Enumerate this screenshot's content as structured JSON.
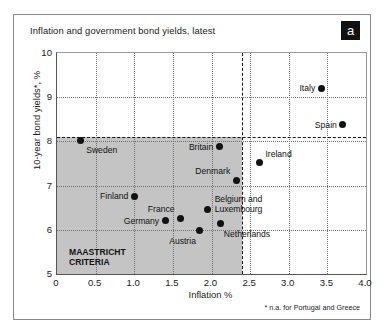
{
  "figure": {
    "title": "Inflation and government bond yields, latest",
    "panel_badge": "a",
    "footnote": "* n.a. for Portugal and Greece",
    "colors": {
      "shade": "#c4c4c4",
      "point": "#111111",
      "grid": "#707070",
      "threshold": "#111111",
      "border": "#8a8a8a"
    }
  },
  "axes": {
    "y_ticks": [
      "10",
      "9",
      "8",
      "7",
      "6",
      "5"
    ],
    "x_ticks": [
      "0",
      "0.5",
      "1.0",
      "1.5",
      "2.0",
      "2.5",
      "3.0",
      "3.5",
      "4.0"
    ],
    "ylabel": "10-year bond yields*, %",
    "xlabel": "Inflation %"
  },
  "maastricht": {
    "label_line1": "MAASTRICHT",
    "label_line2": "CRITERIA",
    "inflation_limit": 2.4,
    "yield_limit": 8.1
  },
  "chart_data": {
    "type": "scatter",
    "title": "Inflation and government bond yields, latest",
    "xlabel": "Inflation %",
    "ylabel": "10-year bond yields*, %",
    "xlim": [
      0,
      4.0
    ],
    "ylim": [
      5,
      10
    ],
    "xticks": [
      0,
      0.5,
      1.0,
      1.5,
      2.0,
      2.5,
      3.0,
      3.5,
      4.0
    ],
    "yticks": [
      5,
      6,
      7,
      8,
      9,
      10
    ],
    "grid": "dotted-both",
    "legend": "none",
    "annotations": {
      "maastricht_region": "MAASTRICHT CRITERIA",
      "maastricht_inflation_ceiling": 2.4,
      "maastricht_yield_ceiling": 8.1,
      "footnote": "* n.a. for Portugal and Greece"
    },
    "points": [
      {
        "name": "Sweden",
        "x": 0.3,
        "y": 8.03,
        "label_dx": 6,
        "label_dy": 5,
        "align": "left"
      },
      {
        "name": "Finland",
        "x": 1.0,
        "y": 6.76,
        "label_dx": -6,
        "label_dy": -5,
        "align": "right"
      },
      {
        "name": "Germany",
        "x": 1.4,
        "y": 6.2,
        "label_dx": -6,
        "label_dy": -5,
        "align": "right"
      },
      {
        "name": "France",
        "x": 1.6,
        "y": 6.25,
        "label_dx": -6,
        "label_dy": -15,
        "align": "right"
      },
      {
        "name": "Austria",
        "x": 1.85,
        "y": 5.98,
        "label_dx": -4,
        "label_dy": 5,
        "align": "right"
      },
      {
        "name": "Britain",
        "x": 2.1,
        "y": 7.88,
        "label_dx": -6,
        "label_dy": -5,
        "align": "right"
      },
      {
        "name": "Denmark",
        "x": 2.32,
        "y": 7.12,
        "label_dx": -6,
        "label_dy": -14,
        "align": "right"
      },
      {
        "name": "Belgium and Luxembourg",
        "x": 1.95,
        "y": 6.45,
        "label_dx": 7,
        "label_dy": -15,
        "align": "left",
        "lines": [
          "Belgium and",
          "Luxembourg"
        ]
      },
      {
        "name": "Netherlands",
        "x": 2.12,
        "y": 6.14,
        "label_dx": 3,
        "label_dy": 5,
        "align": "left"
      },
      {
        "name": "Ireland",
        "x": 2.62,
        "y": 7.52,
        "label_dx": 6,
        "label_dy": -14,
        "align": "left"
      },
      {
        "name": "Italy",
        "x": 3.42,
        "y": 9.2,
        "label_dx": -6,
        "label_dy": -5,
        "align": "right"
      },
      {
        "name": "Spain",
        "x": 3.7,
        "y": 8.38,
        "label_dx": -6,
        "label_dy": -5,
        "align": "right"
      }
    ]
  }
}
